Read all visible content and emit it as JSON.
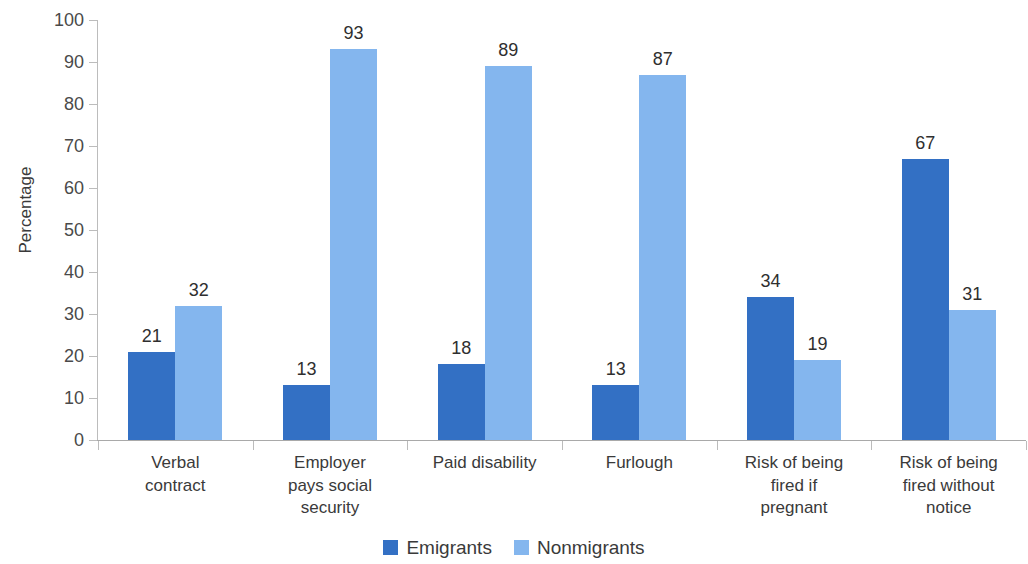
{
  "chart_data": {
    "type": "bar",
    "title": "",
    "xlabel": "",
    "ylabel": "Percentage",
    "ylim": [
      0,
      100
    ],
    "ytick_labels": [
      "100",
      "90",
      "80",
      "70",
      "60",
      "50",
      "40",
      "30",
      "20",
      "10",
      "0"
    ],
    "ytick_values": [
      100,
      90,
      80,
      70,
      60,
      50,
      40,
      30,
      20,
      10,
      0
    ],
    "grid": false,
    "legend_position": "bottom-center",
    "categories": [
      "Verbal contract",
      "Employer pays social security",
      "Paid disability",
      "Furlough",
      "Risk of being fired if pregnant",
      "Risk of being fired without notice"
    ],
    "category_label_lines": [
      [
        "Verbal",
        "contract"
      ],
      [
        "Employer",
        "pays social",
        "security"
      ],
      [
        "Paid disability"
      ],
      [
        "Furlough"
      ],
      [
        "Risk of being",
        "fired if",
        "pregnant"
      ],
      [
        "Risk of being",
        "fired without",
        "notice"
      ]
    ],
    "series": [
      {
        "name": "Emigrants",
        "color": "#3370C4",
        "values": [
          21,
          13,
          18,
          13,
          34,
          67
        ],
        "value_labels": [
          "21",
          "13",
          "18",
          "13",
          "34",
          "67"
        ]
      },
      {
        "name": "Nonmigrants",
        "color": "#84B6EE",
        "values": [
          32,
          93,
          89,
          87,
          19,
          31
        ],
        "value_labels": [
          "32",
          "93",
          "89",
          "87",
          "19",
          "31"
        ]
      }
    ]
  },
  "colors": {
    "emigrants": "#3370C4",
    "nonmigrants": "#84B6EE",
    "axis": "#a9a9a9",
    "tick": "#bcbcbc",
    "text": "#3a3a3a"
  }
}
